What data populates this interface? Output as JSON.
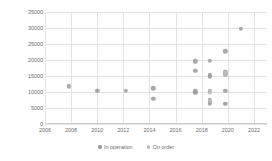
{
  "chart_data": {
    "type": "scatter",
    "title": "",
    "xlabel": "",
    "ylabel": "Gross tonnage",
    "xlim": [
      2006,
      2023
    ],
    "ylim": [
      0,
      35000
    ],
    "grid": true,
    "legend_position": "bottom",
    "x_ticks": [
      "2006",
      "2008",
      "2010",
      "2012",
      "2014",
      "2016",
      "2018",
      "2020",
      "2022"
    ],
    "x_tick_values": [
      2006,
      2008,
      2010,
      2012,
      2014,
      2016,
      2018,
      2020,
      2022
    ],
    "y_ticks": [
      "0",
      "5000",
      "10000",
      "15000",
      "20000",
      "25000",
      "30000",
      "35000"
    ],
    "y_tick_values": [
      0,
      5000,
      10000,
      15000,
      20000,
      25000,
      30000,
      35000
    ],
    "series": [
      {
        "name": "In operation",
        "color": "#9a9a9a",
        "points": [
          {
            "x": 2007.8,
            "y": 11800
          },
          {
            "x": 2010.0,
            "y": 10300
          },
          {
            "x": 2012.2,
            "y": 10400
          },
          {
            "x": 2014.3,
            "y": 11200
          },
          {
            "x": 2014.3,
            "y": 7900
          },
          {
            "x": 2017.5,
            "y": 19600
          },
          {
            "x": 2017.5,
            "y": 16700
          },
          {
            "x": 2017.5,
            "y": 10200
          },
          {
            "x": 2017.5,
            "y": 9800
          },
          {
            "x": 2018.6,
            "y": 19700
          },
          {
            "x": 2018.6,
            "y": 15200
          },
          {
            "x": 2018.6,
            "y": 14700
          },
          {
            "x": 2018.6,
            "y": 10300
          },
          {
            "x": 2018.6,
            "y": 7500
          },
          {
            "x": 2018.6,
            "y": 6900
          },
          {
            "x": 2018.6,
            "y": 6300
          },
          {
            "x": 2019.8,
            "y": 22700
          },
          {
            "x": 2019.8,
            "y": 16200
          },
          {
            "x": 2019.8,
            "y": 15400
          },
          {
            "x": 2019.8,
            "y": 10400
          },
          {
            "x": 2019.8,
            "y": 6400
          },
          {
            "x": 2021.0,
            "y": 29700
          }
        ]
      },
      {
        "name": "On order",
        "color": "#bdbdbd",
        "points": [
          {
            "x": 2018.6,
            "y": 9900
          },
          {
            "x": 2018.6,
            "y": 7200
          },
          {
            "x": 2019.8,
            "y": 15800
          }
        ]
      }
    ],
    "legend": [
      {
        "label": "In operation",
        "color": "#9a9a9a"
      },
      {
        "label": "On order",
        "color": "#bdbdbd"
      }
    ]
  },
  "style": {
    "grid_color": "#e2e2e2",
    "text_color": "#6b6b6b",
    "background": "#ffffff"
  }
}
